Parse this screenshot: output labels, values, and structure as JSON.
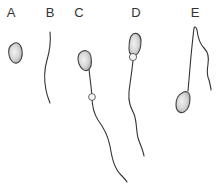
{
  "figure": {
    "colors": {
      "stroke": "#333333",
      "head_fill_light": "#f2f2f2",
      "head_fill_dark": "#a8a8a8"
    },
    "panels": [
      {
        "id": "A",
        "label": "A",
        "content": "detached head (no tail)",
        "label_x": 11
      },
      {
        "id": "B",
        "label": "B",
        "content": "detached tail (no head)",
        "label_x": 50
      },
      {
        "id": "C",
        "label": "C",
        "content": "sperm with distal cytoplasmic droplet",
        "label_x": 79
      },
      {
        "id": "D",
        "label": "D",
        "content": "sperm with proximal cytoplasmic droplet",
        "label_x": 136
      },
      {
        "id": "E",
        "label": "E",
        "content": "sperm with bent / folded tail",
        "label_x": 195
      }
    ]
  }
}
